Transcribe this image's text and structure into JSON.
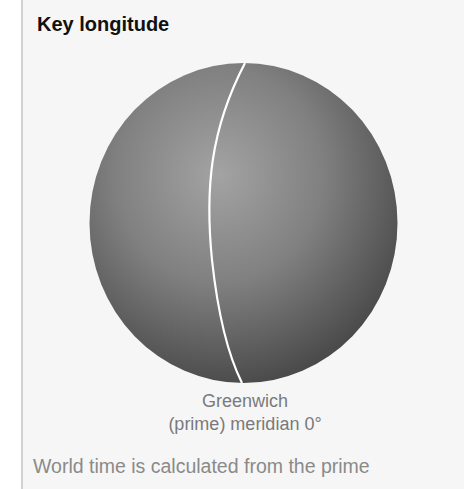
{
  "title": "Key longitude",
  "diagram": {
    "line": "prime-meridian",
    "label_line1": "Greenwich",
    "label_line2": "(prime) meridian 0°",
    "colors": {
      "globe_light": "#a0a0a0",
      "globe_dark": "#3e3e3e",
      "meridian": "#ffffff",
      "background": "#f6f6f6"
    }
  },
  "body_text": "World time is calculated from the prime"
}
